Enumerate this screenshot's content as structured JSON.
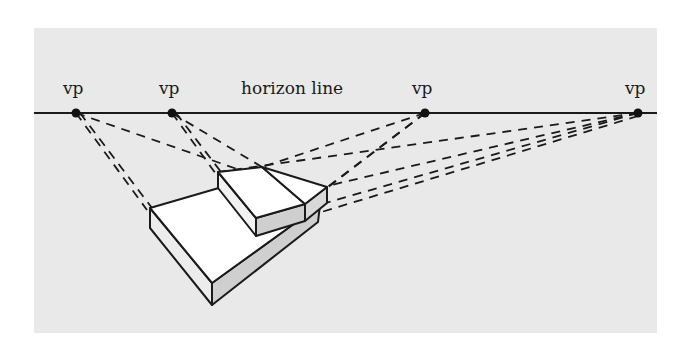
{
  "diagram": {
    "colors": {
      "background": "#ffffff",
      "panel": "#e9e9e9",
      "ink": "#1a1a1a",
      "face_light": "#ffffff",
      "face_shade": "#cfcfcf"
    },
    "horizon": {
      "label": "horizon line",
      "y": 113
    },
    "vanishing_points": [
      {
        "label": "vp",
        "x": 76,
        "y": 113
      },
      {
        "label": "vp",
        "x": 172,
        "y": 113
      },
      {
        "label": "vp",
        "x": 425,
        "y": 113
      },
      {
        "label": "vp",
        "x": 638,
        "y": 113
      }
    ],
    "objects": [
      {
        "name": "lower slab",
        "description": "large wedge-shaped slab in perspective"
      },
      {
        "name": "upper slab",
        "description": "smaller slab resting on the lower slab, divided into two blocks"
      }
    ],
    "construction_lines": "dashed lines from object edges converging to each vanishing point"
  }
}
